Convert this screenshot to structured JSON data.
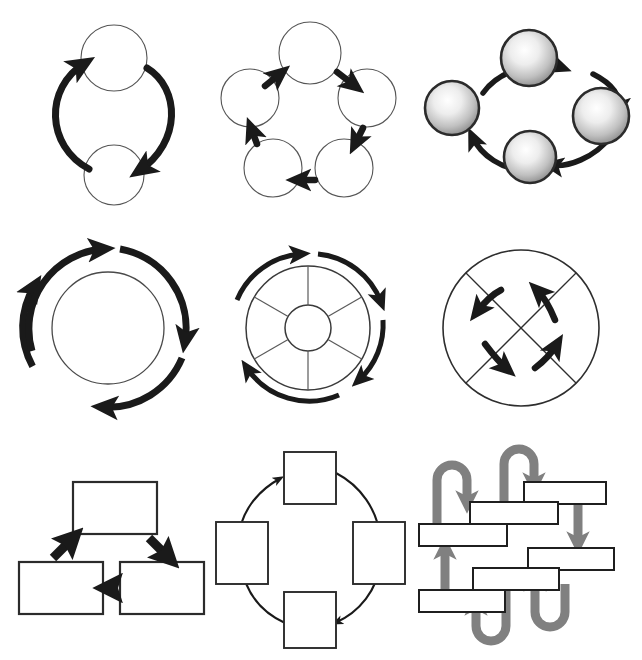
{
  "figure": {
    "background_color": "#ffffff",
    "grid": {
      "rows": 3,
      "columns": 3,
      "total_cells": 9
    },
    "palette": {
      "stroke_dark": "#1a1a1a",
      "outline_thin": "#4d4d4d",
      "arrow_black": "#1a1a1a",
      "arrow_gray": "#808080",
      "node_fill": "#ffffff",
      "sphere_light": "#ffffff",
      "sphere_mid": "#c9c9c9",
      "sphere_dark": "#8c8c8c"
    }
  },
  "cells": [
    {
      "id": "two-node-cycle",
      "name": "Two node circular cycle",
      "row": 0,
      "column": 0,
      "node_shape": "circle",
      "node_count": 2,
      "node_style": "outline",
      "arrow_count": 2,
      "arrow_style": "thick curved",
      "arrow_color": "#1a1a1a",
      "direction": "clockwise"
    },
    {
      "id": "five-node-pentagon-cycle",
      "name": "Five node pentagon cycle",
      "row": 0,
      "column": 1,
      "node_shape": "circle",
      "node_count": 5,
      "node_style": "outline",
      "arrow_count": 5,
      "arrow_style": "thick straight",
      "arrow_color": "#1a1a1a",
      "direction": "clockwise"
    },
    {
      "id": "four-sphere-cycle",
      "name": "Four shaded sphere cycle",
      "row": 0,
      "column": 2,
      "node_shape": "sphere",
      "node_count": 4,
      "node_style": "radial-gradient 3D",
      "arrow_count": 4,
      "arrow_style": "thick curved",
      "arrow_color": "#1a1a1a",
      "direction": "clockwise"
    },
    {
      "id": "three-arc-ring",
      "name": "Three arc ring around circle",
      "row": 1,
      "column": 0,
      "node_shape": "circle",
      "node_count": 1,
      "node_style": "outline",
      "arrow_count": 3,
      "arrow_style": "thick curved arc",
      "arrow_color": "#1a1a1a",
      "direction": "clockwise"
    },
    {
      "id": "spoked-wheel-cycle",
      "name": "Spoked wheel with outer arc arrows",
      "row": 1,
      "column": 1,
      "node_shape": "wheel",
      "spoke_count": 6,
      "node_count": 1,
      "node_style": "outline wheel with hub",
      "arrow_count": 4,
      "arrow_style": "curved arc",
      "arrow_color": "#1a1a1a",
      "direction": "clockwise"
    },
    {
      "id": "crossed-circle-rotation",
      "name": "Circle with X chords and four rotating arrows",
      "row": 1,
      "column": 2,
      "node_shape": "circle",
      "node_count": 1,
      "node_style": "outline with crossed diagonals",
      "arrow_count": 4,
      "arrow_style": "thick short curved",
      "arrow_color": "#1a1a1a",
      "direction": "counter-clockwise"
    },
    {
      "id": "three-box-triangle-cycle",
      "name": "Three rectangle triangular cycle",
      "row": 2,
      "column": 0,
      "node_shape": "rectangle",
      "node_count": 3,
      "node_style": "outline",
      "arrow_count": 3,
      "arrow_style": "thick straight block",
      "arrow_color": "#1a1a1a",
      "direction": "clockwise"
    },
    {
      "id": "four-box-circular-cycle",
      "name": "Four square circular cycle",
      "row": 2,
      "column": 1,
      "node_shape": "square",
      "node_count": 4,
      "node_style": "outline",
      "arrow_count": 4,
      "arrow_style": "thin curved",
      "arrow_color": "#1a1a1a",
      "direction": "clockwise"
    },
    {
      "id": "serpentine-bar-flow",
      "name": "Serpentine bar flow with gray U-turn arrows",
      "row": 2,
      "column": 2,
      "node_shape": "bar",
      "node_count": 6,
      "node_style": "outline horizontal bar",
      "arrow_count": 7,
      "arrow_style": "thick gray U-turn and straight",
      "arrow_color": "#808080",
      "direction": "serpentine"
    }
  ]
}
